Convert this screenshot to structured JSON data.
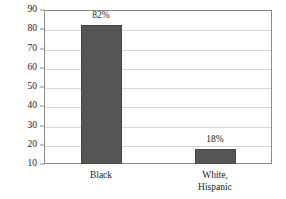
{
  "chart_data": {
    "type": "bar",
    "title": "",
    "subtitle": "",
    "xlabel": "",
    "ylabel": "",
    "categories": [
      "Black",
      "White,\nHispanic"
    ],
    "values": [
      82,
      18
    ],
    "data_labels": [
      "82%",
      "18%"
    ],
    "ylim": [
      10,
      90
    ],
    "yticks": [
      10,
      20,
      30,
      40,
      50,
      60,
      70,
      80,
      90
    ],
    "ytick_labels": [
      "10",
      "20",
      "30",
      "40",
      "50",
      "60",
      "70",
      "80",
      "90"
    ],
    "grid": true,
    "grid_axis": "y",
    "legend": false,
    "legend_position": "none",
    "series": [
      {
        "name": "",
        "values": [
          82,
          18
        ]
      }
    ],
    "colors": {
      "bar_fill": "#555558",
      "bar_edge": "#47474a",
      "gridline": "#d6d6d6",
      "axis_line": "#8a8a8a",
      "text": "#1a1a1a",
      "background": "#ffffff"
    }
  }
}
